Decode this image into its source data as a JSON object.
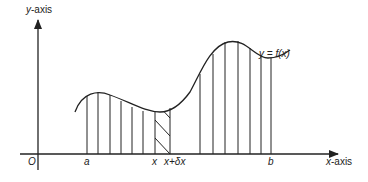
{
  "diagram": {
    "type": "area-under-curve",
    "y_axis_label_var": "y",
    "y_axis_label_rest": "-axis",
    "x_axis_label_var": "x",
    "x_axis_label_rest": "-axis",
    "origin_label": "O",
    "curve_label": "y = f(x)",
    "tick_labels": {
      "a": "a",
      "x": "x",
      "x_plus_dx": "x+δx",
      "b": "b"
    },
    "strip_count_left": 6,
    "strip_count_right": 6,
    "colors": {
      "line": "#222222",
      "background": "#ffffff"
    }
  }
}
